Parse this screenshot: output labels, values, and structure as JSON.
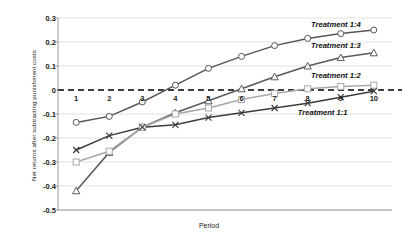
{
  "chart_data": {
    "type": "line",
    "title": "",
    "xlabel": "Period",
    "ylabel": "Net returns after subtracting punishment costs",
    "x": [
      1,
      2,
      3,
      4,
      5,
      6,
      7,
      8,
      9,
      10
    ],
    "xticklabels": [
      "1",
      "2",
      "3",
      "4",
      "5",
      "6",
      "7",
      "8",
      "9",
      "10"
    ],
    "yticklabels": [
      "0.3",
      "0.2",
      "0.1",
      "0",
      "-0.1",
      "-0.2",
      "-0.3",
      "-0.4",
      "-0.5"
    ],
    "ytickvalues": [
      0.3,
      0.2,
      0.1,
      0,
      -0.1,
      -0.2,
      -0.3,
      -0.4,
      -0.5
    ],
    "ylim": [
      -0.5,
      0.3
    ],
    "xlim": [
      0.45,
      10.55
    ],
    "grid": true,
    "legend_position": "inline-right",
    "zero_reference_line": 0,
    "series": [
      {
        "name": "Treatment 1:4",
        "marker": "circle",
        "color": "#555555",
        "values": [
          -0.135,
          -0.11,
          -0.05,
          0.02,
          0.09,
          0.14,
          0.185,
          0.215,
          0.235,
          0.25
        ]
      },
      {
        "name": "Treatment 1:3",
        "marker": "triangle",
        "color": "#5a5a5a",
        "values": [
          -0.42,
          -0.26,
          -0.155,
          -0.095,
          -0.045,
          0.005,
          0.055,
          0.1,
          0.135,
          0.155
        ]
      },
      {
        "name": "Treatment 1:2",
        "marker": "square",
        "color": "#a8a8a8",
        "values": [
          -0.3,
          -0.255,
          -0.155,
          -0.1,
          -0.075,
          -0.04,
          -0.015,
          0.005,
          0.015,
          0.02
        ]
      },
      {
        "name": "Treatment 1:1",
        "marker": "x",
        "color": "#3d3d3d",
        "values": [
          -0.25,
          -0.19,
          -0.155,
          -0.145,
          -0.115,
          -0.095,
          -0.075,
          -0.055,
          -0.03,
          -0.005
        ]
      }
    ],
    "series_labels": [
      {
        "text": "Treatment 1:4",
        "x": 8.1,
        "y": 0.272
      },
      {
        "text": "Treatment 1:3",
        "x": 8.1,
        "y": 0.183
      },
      {
        "text": "Treatment 1:2",
        "x": 8.1,
        "y": 0.06
      },
      {
        "text": "Treatment 1:1",
        "x": 7.7,
        "y": -0.095
      }
    ]
  },
  "colors": {
    "grid": "#d9d9d9",
    "axis": "#9a9a9a",
    "zero_line": "#000000",
    "text": "#1a1a1a"
  }
}
